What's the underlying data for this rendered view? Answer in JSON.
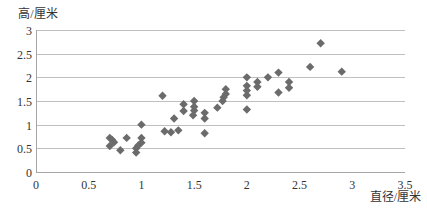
{
  "chart_data": {
    "type": "scatter",
    "title": "",
    "xlabel": "直径/厘米",
    "ylabel": "高/厘米",
    "xlim": [
      0,
      3.5
    ],
    "ylim": [
      0,
      3
    ],
    "x_ticks": [
      0,
      0.5,
      1,
      1.5,
      2,
      2.5,
      3,
      3.5
    ],
    "y_ticks": [
      0,
      0.5,
      1,
      1.5,
      2,
      2.5,
      3
    ],
    "x_tick_labels": [
      "0",
      "0.5",
      "1",
      "1.5",
      "2",
      "2.5",
      "3",
      "3.5"
    ],
    "y_tick_labels": [
      "0",
      "0.5",
      "1",
      "1.5",
      "2",
      "2.5",
      "3"
    ],
    "grid": "horizontal",
    "legend": null,
    "marker": "diamond",
    "marker_color": "#6b6b6b",
    "grid_color": "#bfbfbf",
    "axis_color": "#a6a6a6",
    "points": [
      [
        0.7,
        0.72
      ],
      [
        0.72,
        0.68
      ],
      [
        0.74,
        0.63
      ],
      [
        0.7,
        0.55
      ],
      [
        0.8,
        0.46
      ],
      [
        0.86,
        0.72
      ],
      [
        0.95,
        0.5
      ],
      [
        0.95,
        0.41
      ],
      [
        0.97,
        0.56
      ],
      [
        1.0,
        0.62
      ],
      [
        1.0,
        0.72
      ],
      [
        1.0,
        1.0
      ],
      [
        1.2,
        1.61
      ],
      [
        1.22,
        0.86
      ],
      [
        1.28,
        0.84
      ],
      [
        1.35,
        0.88
      ],
      [
        1.31,
        1.13
      ],
      [
        1.4,
        1.29
      ],
      [
        1.4,
        1.43
      ],
      [
        1.5,
        1.5
      ],
      [
        1.49,
        1.2
      ],
      [
        1.5,
        1.38
      ],
      [
        1.5,
        1.3
      ],
      [
        1.6,
        1.25
      ],
      [
        1.6,
        1.13
      ],
      [
        1.6,
        0.82
      ],
      [
        1.72,
        1.36
      ],
      [
        1.8,
        1.75
      ],
      [
        1.8,
        1.65
      ],
      [
        1.78,
        1.58
      ],
      [
        1.77,
        1.5
      ],
      [
        2.0,
        2.0
      ],
      [
        2.0,
        1.82
      ],
      [
        2.0,
        1.72
      ],
      [
        2.0,
        1.62
      ],
      [
        2.0,
        1.32
      ],
      [
        2.1,
        1.9
      ],
      [
        2.1,
        1.8
      ],
      [
        2.2,
        2.0
      ],
      [
        2.3,
        2.1
      ],
      [
        2.3,
        1.68
      ],
      [
        2.4,
        1.9
      ],
      [
        2.4,
        1.78
      ],
      [
        2.6,
        2.22
      ],
      [
        2.7,
        2.72
      ],
      [
        2.9,
        2.12
      ]
    ]
  }
}
